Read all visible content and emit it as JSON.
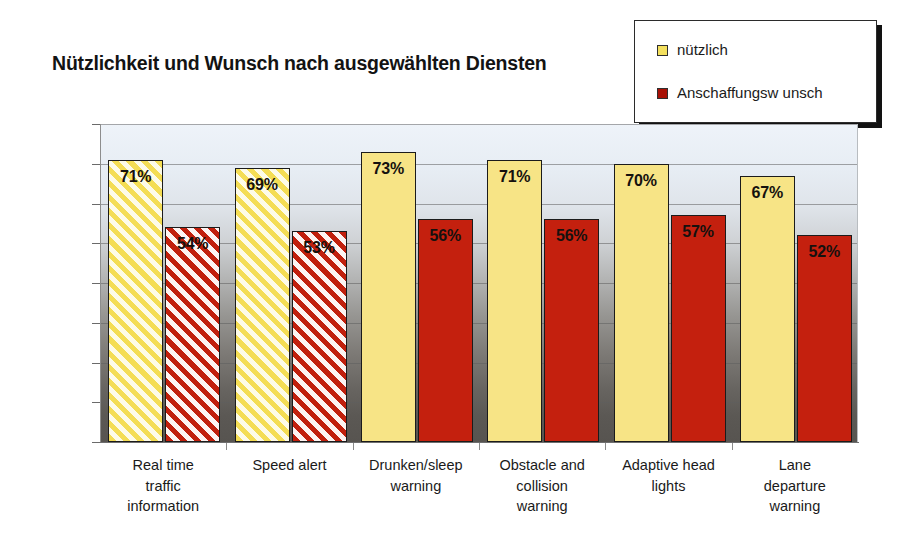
{
  "chart_data": {
    "type": "bar",
    "title": "Nützlichkeit und Wunsch nach ausgewählten Diensten",
    "xlabel": "",
    "ylabel": "",
    "ylim": [
      0,
      80
    ],
    "ytick_labels": [
      "80%",
      "70%",
      "60%",
      "50%",
      "40%",
      "30%",
      "20%",
      "10%",
      "0%"
    ],
    "ytick_values": [
      80,
      70,
      60,
      50,
      40,
      30,
      20,
      10,
      0
    ],
    "grid": true,
    "legend_position": "top-right",
    "categories": [
      "Real time traffic information",
      "Speed alert",
      "Drunken/sleep warning",
      "Obstacle and collision warning",
      "Adaptive head lights",
      "Lane departure warning"
    ],
    "category_lines": [
      [
        "Real time",
        "traffic",
        "information"
      ],
      [
        "Speed alert"
      ],
      [
        "Drunken/sleep",
        "warning"
      ],
      [
        "Obstacle and",
        "collision",
        "warning"
      ],
      [
        "Adaptive head",
        "lights"
      ],
      [
        "Lane",
        "departure",
        "warning"
      ]
    ],
    "series": [
      {
        "name": "nützlich",
        "color": "#f7e486",
        "values": [
          71,
          69,
          73,
          71,
          70,
          67
        ],
        "labels": [
          "71%",
          "69%",
          "73%",
          "71%",
          "70%",
          "67%"
        ],
        "fill_pattern": [
          "hatch",
          "hatch",
          "solid",
          "solid",
          "solid",
          "solid"
        ]
      },
      {
        "name": "Anschaffungsw unsch",
        "color": "#c4200e",
        "values": [
          54,
          53,
          56,
          56,
          57,
          52
        ],
        "labels": [
          "54%",
          "53%",
          "56%",
          "56%",
          "57%",
          "52%"
        ],
        "fill_pattern": [
          "hatch",
          "hatch",
          "solid",
          "solid",
          "solid",
          "solid"
        ]
      }
    ]
  },
  "legend": {
    "items": [
      {
        "label": "nützlich",
        "color": "#f4e05e"
      },
      {
        "label": "Anschaffungsw unsch",
        "color": "#a81106"
      }
    ]
  },
  "colors": {
    "yellow": "#f7e486",
    "red": "#c4200e",
    "plot_top": "#eef3f9",
    "plot_bottom": "#575450",
    "text": "#1a1a1a"
  }
}
